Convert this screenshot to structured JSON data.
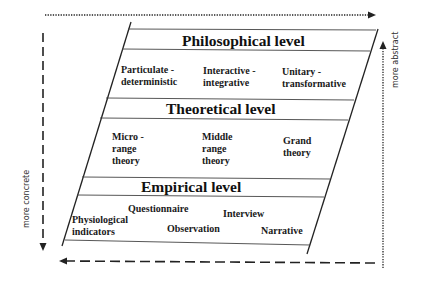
{
  "diagram": {
    "levels": [
      {
        "title": "Philosophical level",
        "items": [
          "Particulate -",
          "deterministic",
          "Interactive -",
          "integrative",
          "Unitary -",
          "transformative"
        ]
      },
      {
        "title": "Theoretical level",
        "items": [
          "Micro -",
          "range",
          "theory",
          "Middle",
          "range",
          "theory",
          "Grand",
          "theory"
        ]
      },
      {
        "title": "Empirical level",
        "items": [
          "Questionnaire",
          "Interview",
          "Physiological",
          "indicators",
          "Observation",
          "Narrative"
        ]
      }
    ],
    "axes": {
      "right_label": "more abstract",
      "left_label": "more concrete"
    },
    "colors": {
      "line": "#1a1a1a",
      "background": "#ffffff"
    }
  }
}
